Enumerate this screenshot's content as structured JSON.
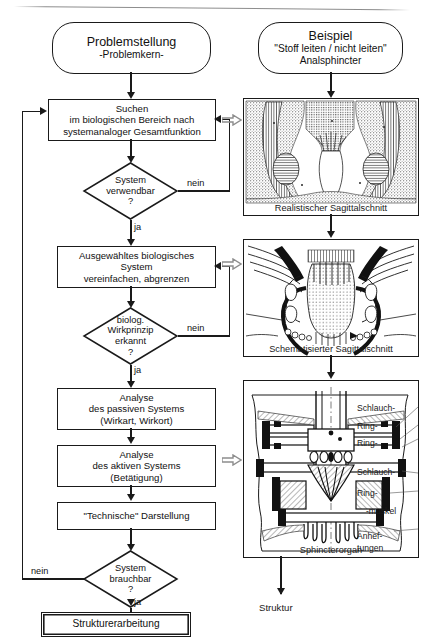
{
  "figure": {
    "type": "flowchart",
    "language": "de",
    "columns": [
      "Problemstellung",
      "Beispiel"
    ]
  },
  "left": {
    "start": {
      "line1": "Problemstellung",
      "line2": "-Problemkern-"
    },
    "steps": [
      {
        "id": "suchen",
        "text": "Suchen\nim biologischen Bereich nach\nsystemanaloger Gesamtfunktion"
      },
      {
        "id": "auswahl",
        "text": "Ausgewähltes biologisches\nSystem\nvereinfachen, abgrenzen"
      },
      {
        "id": "analyse-passiv",
        "text": "Analyse\ndes passiven Systems\n(Wirkart, Wirkort)"
      },
      {
        "id": "analyse-aktiv",
        "text": "Analyse\ndes aktiven Systems\n(Betätigung)"
      },
      {
        "id": "technische-darstellung",
        "text": "\"Technische\" Darstellung"
      }
    ],
    "decisions": [
      {
        "id": "system-verwendbar",
        "text": "System\nverwendbar\n?",
        "yes_label": "ja",
        "no_label": "nein"
      },
      {
        "id": "wirkprinzip-erkannt",
        "text": "biolog.\nWirkprinzip\nerkannt\n?",
        "yes_label": "ja",
        "no_label": "nein"
      },
      {
        "id": "system-brauchbar",
        "text": "System\nbrauchbar\n?",
        "yes_label": "ja",
        "no_label": "nein"
      }
    ],
    "end": {
      "text": "Strukturerarbeitung"
    }
  },
  "right": {
    "start": {
      "line1": "Beispiel",
      "line2": "\"Stoff leiten / nicht leiten\"",
      "line3": "Analsphincter"
    },
    "panels": [
      {
        "id": "panel-realistisch",
        "caption": "Realistischer Sagittalschnitt",
        "art": "anatomical-histology-cross-section"
      },
      {
        "id": "panel-schematisch",
        "caption": "Schematisierter Sagittalschnitt",
        "art": "schematic-line-cross-section"
      },
      {
        "id": "panel-technisch",
        "caption": "Sphincterorgan",
        "art": "technical-mechanical-section"
      }
    ],
    "annotations": [
      "Schlauch-",
      "Ring-",
      "Ring-",
      "Schlauch-",
      "Ring-",
      "-muskel",
      "Anhef-",
      "tungen"
    ],
    "end": {
      "text": "Struktur"
    }
  },
  "colors": {
    "stroke": "#1a1a1a",
    "background": "#ffffff",
    "block_arrow": "#8d8d8d"
  }
}
